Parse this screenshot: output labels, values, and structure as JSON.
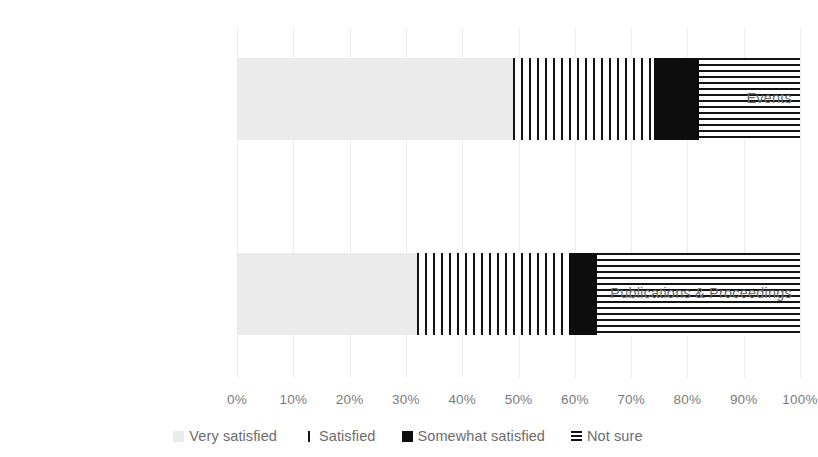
{
  "chart_data": {
    "type": "bar",
    "orientation": "horizontal",
    "stacked": true,
    "normalized": true,
    "title": "",
    "subtitle": "",
    "xlabel": "",
    "ylabel": "",
    "xlim": [
      0,
      100
    ],
    "xticks": [
      "0%",
      "10%",
      "20%",
      "30%",
      "40%",
      "50%",
      "60%",
      "70%",
      "80%",
      "90%",
      "100%"
    ],
    "xtick_values": [
      0,
      10,
      20,
      30,
      40,
      50,
      60,
      70,
      80,
      90,
      100
    ],
    "grid": "vertical-light",
    "legend_position": "bottom",
    "categories": [
      "Events",
      "Publications & Proceedings"
    ],
    "series": [
      {
        "name": "Very satisfied",
        "fill": "solid-light-gray",
        "color": "#ebebeb",
        "values": [
          49,
          32
        ]
      },
      {
        "name": "Satisfied",
        "fill": "vertical-lines",
        "color": "#141414",
        "values": [
          25,
          27
        ]
      },
      {
        "name": "Somewhat satisfied",
        "fill": "solid-black",
        "color": "#0d0d0d",
        "values": [
          8,
          5
        ]
      },
      {
        "name": "Not sure",
        "fill": "horizontal-lines",
        "color": "#141414",
        "values": [
          18,
          36
        ]
      }
    ]
  },
  "axis": {
    "ticks": [
      "0%",
      "10%",
      "20%",
      "30%",
      "40%",
      "50%",
      "60%",
      "70%",
      "80%",
      "90%",
      "100%"
    ]
  },
  "categories": [
    {
      "label": "Events"
    },
    {
      "label": "Publications & Proceedings"
    }
  ],
  "legend": {
    "items": [
      {
        "label": "Very satisfied",
        "marker": "light-gray-square-icon"
      },
      {
        "label": "Satisfied",
        "marker": "vertical-line-square-icon"
      },
      {
        "label": "Somewhat satisfied",
        "marker": "black-square-icon"
      },
      {
        "label": "Not sure",
        "marker": "horizontal-lines-square-icon"
      }
    ]
  }
}
